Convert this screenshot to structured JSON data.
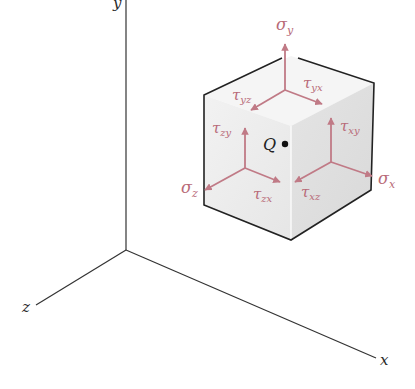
{
  "figure": {
    "axes": {
      "x_label": "x",
      "y_label": "y",
      "z_label": "z"
    },
    "point_label": "Q",
    "stress_labels": {
      "sigma_x": "σx",
      "sigma_y": "σy",
      "sigma_z": "σz",
      "tau_xy": "τxy",
      "tau_xz": "τxz",
      "tau_yx": "τyx",
      "tau_yz": "τyz",
      "tau_zx": "τzx",
      "tau_zy": "τzy"
    },
    "subscripts": {
      "sigma_x": "x",
      "sigma_y": "y",
      "sigma_z": "z",
      "tau_xy": "xy",
      "tau_xz": "xz",
      "tau_yx": "yx",
      "tau_yz": "yz",
      "tau_zx": "zx",
      "tau_zy": "zy"
    },
    "symbols": {
      "sigma": "σ",
      "tau": "τ"
    },
    "colors": {
      "stress_arrow": "#c07a86",
      "cube_top": "#f4f4f4",
      "cube_left": "#ececec",
      "cube_right": "#e2e2e2",
      "edge": "#222222",
      "axis": "#333333"
    }
  }
}
